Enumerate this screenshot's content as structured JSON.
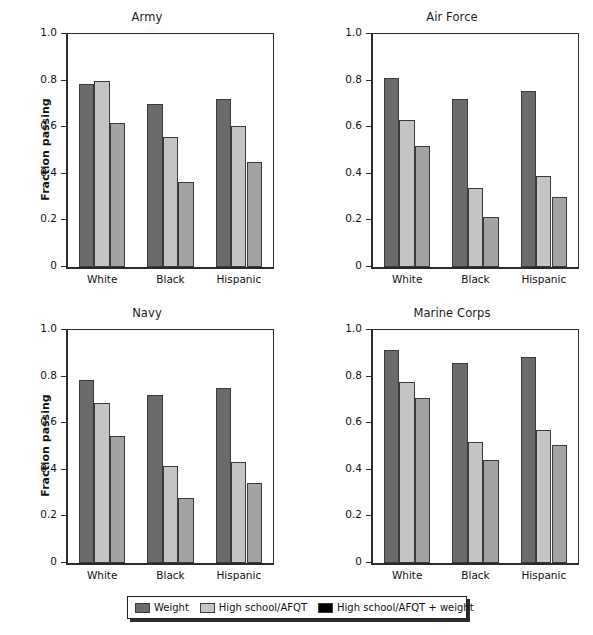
{
  "chart_data": {
    "type": "bar",
    "title": "",
    "categories": [
      "White",
      "Black",
      "Hispanic"
    ],
    "xlabel": "",
    "ylabel": "Fraction passing",
    "ylim": [
      0,
      1.0
    ],
    "yticks": [
      0,
      0.2,
      0.4,
      0.6,
      0.8,
      1.0
    ],
    "ytick_labels": [
      "0",
      "0.2",
      "0.4",
      "0.6",
      "0.8",
      "1.0"
    ],
    "grid": false,
    "legend_position": "bottom",
    "series_names": [
      "Weight",
      "High school/AFQT",
      "High school/AFQT + weight"
    ],
    "series_colors": [
      "#6b6b6b",
      "#c4c4c4",
      "#a3a3a3"
    ],
    "legend_swatch_colors": [
      "#6b6b6b",
      "#c4c4c4",
      "#000000"
    ],
    "panels": [
      {
        "title": "Army",
        "show_ylabel": true,
        "series": [
          {
            "name": "Weight",
            "values": [
              0.785,
              0.7,
              0.722
            ]
          },
          {
            "name": "High school/AFQT",
            "values": [
              0.798,
              0.556,
              0.606
            ]
          },
          {
            "name": "High school/AFQT + weight",
            "values": [
              0.62,
              0.366,
              0.452
            ]
          }
        ]
      },
      {
        "title": "Air Force",
        "show_ylabel": false,
        "series": [
          {
            "name": "Weight",
            "values": [
              0.81,
              0.72,
              0.756
            ]
          },
          {
            "name": "High school/AFQT",
            "values": [
              0.63,
              0.34,
              0.392
            ]
          },
          {
            "name": "High school/AFQT + weight",
            "values": [
              0.518,
              0.213,
              0.302
            ]
          }
        ]
      },
      {
        "title": "Navy",
        "show_ylabel": true,
        "series": [
          {
            "name": "Weight",
            "values": [
              0.786,
              0.722,
              0.75
            ]
          },
          {
            "name": "High school/AFQT",
            "values": [
              0.686,
              0.416,
              0.432
            ]
          },
          {
            "name": "High school/AFQT + weight",
            "values": [
              0.545,
              0.28,
              0.344
            ]
          }
        ]
      },
      {
        "title": "Marine Corps",
        "show_ylabel": false,
        "series": [
          {
            "name": "Weight",
            "values": [
              0.914,
              0.86,
              0.886
            ]
          },
          {
            "name": "High school/AFQT",
            "values": [
              0.775,
              0.518,
              0.57
            ]
          },
          {
            "name": "High school/AFQT + weight",
            "values": [
              0.71,
              0.442,
              0.505
            ]
          }
        ]
      }
    ],
    "legend": [
      {
        "label": "Weight",
        "color": "#6b6b6b"
      },
      {
        "label": "High school/AFQT",
        "color": "#c4c4c4"
      },
      {
        "label": "High school/AFQT + weight",
        "color": "#000000"
      }
    ]
  }
}
